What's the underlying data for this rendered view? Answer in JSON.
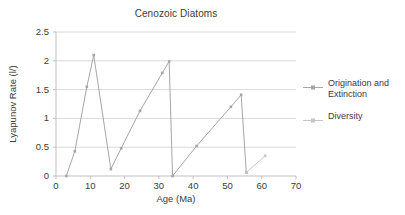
{
  "chart_data": {
    "type": "line",
    "title": "Cenozoic Diatoms",
    "xlabel": "Age (Ma)",
    "ylabel": "Lyapunov Rate (l/)",
    "xlim": [
      0,
      70
    ],
    "ylim": [
      0,
      2.5
    ],
    "xticks": [
      "0",
      "10",
      "20",
      "30",
      "40",
      "50",
      "60",
      "70"
    ],
    "yticks": [
      "0",
      "0.5",
      "1",
      "1.5",
      "2",
      "2.5"
    ],
    "grid": "horizontal",
    "legend_position": "right",
    "series": [
      {
        "name": "Origination and Extinction",
        "color": "#a6a6a6",
        "marker": "square",
        "points": [
          [
            3.0,
            0.0
          ],
          [
            5.5,
            0.43
          ],
          [
            9.0,
            1.55
          ],
          [
            11.0,
            2.1
          ],
          [
            16.0,
            0.12
          ],
          [
            19.0,
            0.48
          ],
          [
            24.5,
            1.13
          ],
          [
            31.0,
            1.79
          ],
          [
            33.0,
            1.99
          ],
          [
            34.0,
            0.0
          ],
          [
            41.0,
            0.52
          ],
          [
            51.0,
            1.2
          ],
          [
            54.0,
            1.41
          ],
          [
            55.5,
            0.06
          ]
        ]
      },
      {
        "name": "Diversity",
        "color": "#c6c6c6",
        "marker": "square",
        "points": [
          [
            55.5,
            0.06
          ],
          [
            61.0,
            0.35
          ]
        ]
      }
    ]
  },
  "legend": {
    "entries": [
      {
        "label_line1": "Origination and",
        "label_line2": "Extinction"
      },
      {
        "label_line1": "Diversity",
        "label_line2": ""
      }
    ]
  },
  "colors": {
    "axis": "#bfbfbf",
    "grid": "#d9d9d9",
    "text": "#3b3b3b",
    "series1": "#a6a6a6",
    "series2": "#c6c6c6",
    "background": "#ffffff"
  }
}
